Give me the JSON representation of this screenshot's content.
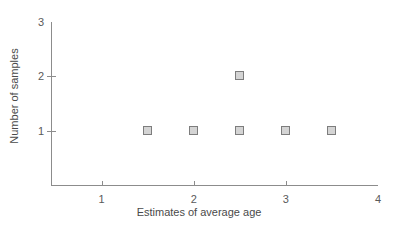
{
  "chart_data": {
    "type": "scatter",
    "title": "",
    "xlabel": "Estimates of average age",
    "ylabel": "Number of samples",
    "xlim": [
      0.45,
      4.0
    ],
    "ylim": [
      0,
      3.0
    ],
    "xticks": [
      1,
      2,
      3,
      4
    ],
    "xtick_labels": [
      "1",
      "2",
      "3",
      "4"
    ],
    "yticks": [
      1,
      2,
      3
    ],
    "ytick_labels": [
      "1",
      "2",
      "3"
    ],
    "grid": false,
    "legend": null,
    "marker": "square",
    "marker_face_color": "#d4d4d4",
    "marker_edge_color": "#7d7d7d",
    "axis_color": "#8c8c8c",
    "background_color": "#ffffff",
    "points": [
      {
        "x": 1.5,
        "y": 1
      },
      {
        "x": 2.0,
        "y": 1
      },
      {
        "x": 2.5,
        "y": 1
      },
      {
        "x": 2.5,
        "y": 2
      },
      {
        "x": 3.0,
        "y": 1
      },
      {
        "x": 3.5,
        "y": 1
      }
    ]
  }
}
